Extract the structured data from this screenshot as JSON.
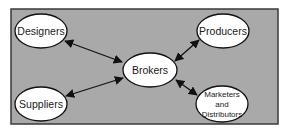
{
  "diagram": {
    "background_color": "#a9a9a9",
    "border_color": "#3a3a3a",
    "node_fill": "#ffffff",
    "node_stroke": "#111111",
    "edge_color": "#111111",
    "nodes": {
      "designers": {
        "label": "Designers"
      },
      "producers": {
        "label": "Producers"
      },
      "brokers": {
        "label": "Brokers"
      },
      "suppliers": {
        "label": "Suppliers"
      },
      "marketers": {
        "label_lines": [
          "Marketers",
          "and",
          "Distributors"
        ]
      }
    },
    "edges": [
      {
        "from": "Designers",
        "to": "Brokers",
        "direction": "bidirectional"
      },
      {
        "from": "Producers",
        "to": "Brokers",
        "direction": "bidirectional"
      },
      {
        "from": "Suppliers",
        "to": "Brokers",
        "direction": "bidirectional"
      },
      {
        "from": "Marketers and Distributors",
        "to": "Brokers",
        "direction": "bidirectional"
      }
    ]
  }
}
